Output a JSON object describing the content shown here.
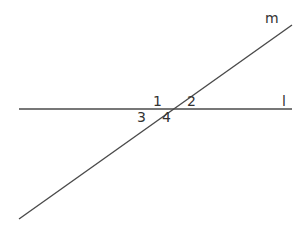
{
  "diagram": {
    "type": "geometry",
    "lines": [
      {
        "name": "l",
        "label": "l",
        "x1": 19,
        "y1": 109,
        "x2": 292,
        "y2": 109,
        "label_x": 282,
        "label_y": 106
      },
      {
        "name": "m",
        "label": "m",
        "x1": 19,
        "y1": 219,
        "x2": 292,
        "y2": 25,
        "label_x": 265,
        "label_y": 23
      }
    ],
    "intersection": {
      "x": 168,
      "y": 109
    },
    "angles": [
      {
        "label": "1",
        "x": 153,
        "y": 106
      },
      {
        "label": "2",
        "x": 187,
        "y": 106
      },
      {
        "label": "3",
        "x": 137,
        "y": 122
      },
      {
        "label": "4",
        "x": 162,
        "y": 122
      }
    ],
    "colors": {
      "line": "#4a4a4a",
      "text": "#333333",
      "background": "#ffffff"
    }
  }
}
